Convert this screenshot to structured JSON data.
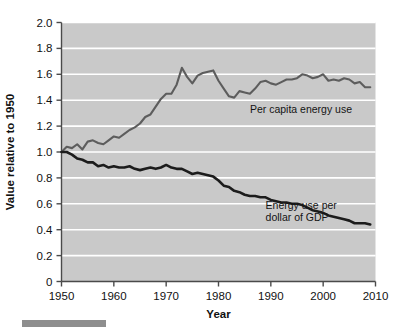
{
  "chart_data": {
    "type": "line",
    "title": "",
    "xlabel": "Year",
    "ylabel": "Value relative to 1950",
    "xlim": [
      1950,
      2010
    ],
    "ylim": [
      0,
      2.0
    ],
    "grid": true,
    "grid_orientation": "horizontal",
    "legend_position": "inline-annotations",
    "plot_background_color": "#c9c9c9",
    "gridline_color": "#ffffff",
    "xticks": [
      1950,
      1960,
      1970,
      1980,
      1990,
      2000,
      2010
    ],
    "xtick_labels": [
      "1950",
      "1960",
      "1970",
      "1980",
      "1990",
      "2000",
      "2010"
    ],
    "yticks": [
      0,
      0.2,
      0.4,
      0.6,
      0.8,
      1.0,
      1.2,
      1.4,
      1.6,
      1.8,
      2.0
    ],
    "ytick_labels": [
      "0",
      "0.2",
      "0.4",
      "0.6",
      "0.8",
      "1.0",
      "1.2",
      "1.4",
      "1.6",
      "1.8",
      "2.0"
    ],
    "x": [
      1950,
      1951,
      1952,
      1953,
      1954,
      1955,
      1956,
      1957,
      1958,
      1959,
      1960,
      1961,
      1962,
      1963,
      1964,
      1965,
      1966,
      1967,
      1968,
      1969,
      1970,
      1971,
      1972,
      1973,
      1974,
      1975,
      1976,
      1977,
      1978,
      1979,
      1980,
      1981,
      1982,
      1983,
      1984,
      1985,
      1986,
      1987,
      1988,
      1989,
      1990,
      1991,
      1992,
      1993,
      1994,
      1995,
      1996,
      1997,
      1998,
      1999,
      2000,
      2001,
      2002,
      2003,
      2004,
      2005,
      2006,
      2007,
      2008,
      2009
    ],
    "series": [
      {
        "name": "Per capita energy use",
        "color": "#5d5d5d",
        "label_x": 1986,
        "label_y": 1.3,
        "values": [
          1.0,
          1.04,
          1.03,
          1.06,
          1.02,
          1.08,
          1.09,
          1.07,
          1.06,
          1.09,
          1.12,
          1.11,
          1.14,
          1.17,
          1.19,
          1.22,
          1.27,
          1.29,
          1.35,
          1.41,
          1.45,
          1.45,
          1.52,
          1.65,
          1.58,
          1.53,
          1.59,
          1.61,
          1.62,
          1.63,
          1.55,
          1.49,
          1.43,
          1.42,
          1.47,
          1.46,
          1.45,
          1.49,
          1.54,
          1.55,
          1.53,
          1.52,
          1.54,
          1.56,
          1.56,
          1.57,
          1.6,
          1.59,
          1.57,
          1.58,
          1.6,
          1.55,
          1.56,
          1.55,
          1.57,
          1.56,
          1.53,
          1.54,
          1.5,
          1.5
        ]
      },
      {
        "name": "Energy use per dollar of GDP",
        "color": "#1c1c1c",
        "label_x": 1989,
        "label_y": 0.53,
        "values": [
          1.0,
          1.0,
          0.98,
          0.95,
          0.94,
          0.92,
          0.92,
          0.89,
          0.9,
          0.88,
          0.89,
          0.88,
          0.88,
          0.89,
          0.87,
          0.86,
          0.87,
          0.88,
          0.87,
          0.88,
          0.9,
          0.88,
          0.87,
          0.87,
          0.85,
          0.83,
          0.84,
          0.83,
          0.82,
          0.81,
          0.78,
          0.74,
          0.73,
          0.7,
          0.69,
          0.67,
          0.66,
          0.66,
          0.65,
          0.65,
          0.63,
          0.62,
          0.61,
          0.61,
          0.6,
          0.6,
          0.59,
          0.57,
          0.55,
          0.54,
          0.53,
          0.51,
          0.5,
          0.49,
          0.48,
          0.47,
          0.45,
          0.45,
          0.45,
          0.44
        ]
      }
    ],
    "annotations": [
      {
        "text": "Per capita energy use",
        "x": 1986,
        "y": 1.3
      },
      {
        "text": "Energy use per",
        "x": 1989,
        "y": 0.56
      },
      {
        "text": "dollar of GDP",
        "x": 1989,
        "y": 0.47
      }
    ]
  }
}
